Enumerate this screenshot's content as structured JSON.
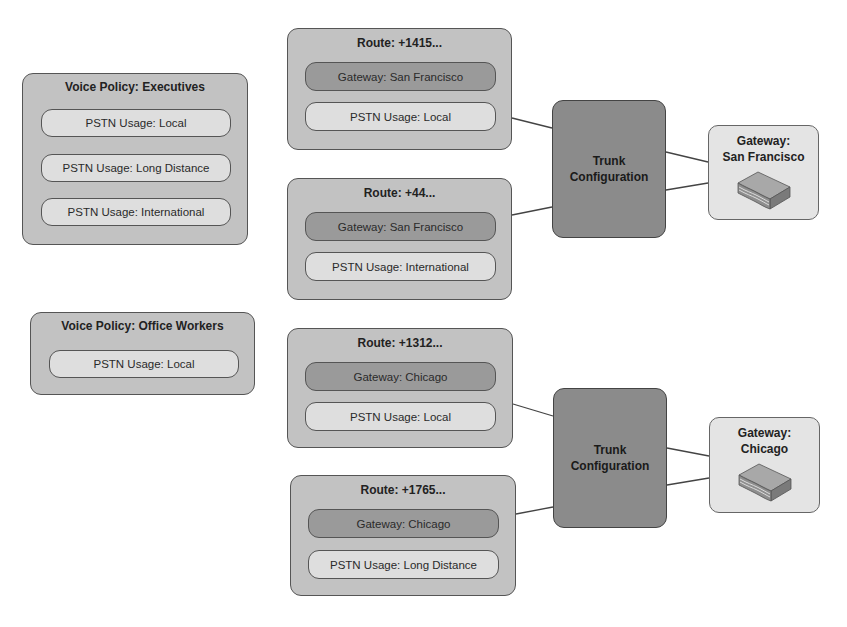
{
  "voice_policies": [
    {
      "title": "Voice Policy: Executives",
      "usages": [
        "PSTN Usage: Local",
        "PSTN Usage: Long Distance",
        "PSTN Usage: International"
      ]
    },
    {
      "title": "Voice Policy: Office Workers",
      "usages": [
        "PSTN Usage: Local"
      ]
    }
  ],
  "routes": [
    {
      "title": "Route: +1415...",
      "gateway": "Gateway: San Francisco",
      "usage": "PSTN Usage: Local"
    },
    {
      "title": "Route: +44...",
      "gateway": "Gateway: San Francisco",
      "usage": "PSTN Usage: International"
    },
    {
      "title": "Route: +1312...",
      "gateway": "Gateway: Chicago",
      "usage": "PSTN Usage: Local"
    },
    {
      "title": "Route: +1765...",
      "gateway": "Gateway: Chicago",
      "usage": "PSTN Usage: Long Distance"
    }
  ],
  "trunks": [
    {
      "label_line1": "Trunk",
      "label_line2": "Configuration"
    },
    {
      "label_line1": "Trunk",
      "label_line2": "Configuration"
    }
  ],
  "gateways": [
    {
      "label_line1": "Gateway:",
      "label_line2": "San Francisco",
      "icon": "gateway-device-icon"
    },
    {
      "label_line1": "Gateway:",
      "label_line2": "Chicago",
      "icon": "gateway-device-icon"
    }
  ],
  "colors": {
    "container": "#c2c2c2",
    "pill_light": "#dedede",
    "pill_dark": "#9a9a9a",
    "trunk": "#8b8b8b",
    "gateway_box": "#e4e4e4",
    "border": "#555555"
  }
}
